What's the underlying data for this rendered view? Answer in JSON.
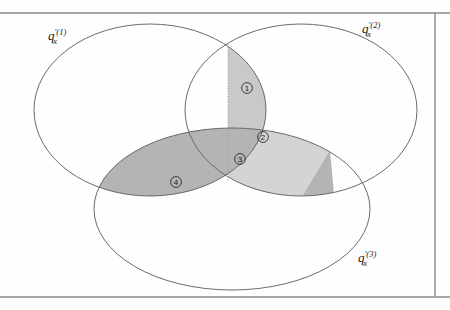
{
  "figure": {
    "kind": "venn-diagram",
    "background_color": "#fefefe",
    "frame_color": "#8a8a8a",
    "outline_color": "#5a5a5a"
  },
  "sets": [
    {
      "id": "set-1",
      "name": "q-prime-x-1",
      "base": "q",
      "prime": "′",
      "superscript": "(1)",
      "subscript": "x",
      "label_x": 48,
      "label_y": 40,
      "cx": 150,
      "cy": 110,
      "rx": 116,
      "ry": 86
    },
    {
      "id": "set-2",
      "name": "q-prime-x-2",
      "base": "q",
      "prime": "′",
      "superscript": "(2)",
      "subscript": "x",
      "label_x": 362,
      "label_y": 33,
      "cx": 301,
      "cy": 110,
      "rx": 116,
      "ry": 86
    },
    {
      "id": "set-3",
      "name": "q-prime-x-3",
      "base": "q",
      "prime": "′",
      "superscript": "(3)",
      "subscript": "x",
      "label_x": 358,
      "label_y": 262,
      "cx": 232,
      "cy": 209,
      "rx": 138,
      "ry": 81
    }
  ],
  "regions": [
    {
      "id": "region-1",
      "number": "①",
      "plain_number": "1",
      "fill": "#c9c9c9",
      "label_x": 247,
      "label_y": 88
    },
    {
      "id": "region-2",
      "number": "②",
      "plain_number": "2",
      "fill": "#d4d4d4",
      "label_x": 263,
      "label_y": 137
    },
    {
      "id": "region-3",
      "number": "③",
      "plain_number": "3",
      "fill": "#b4b4b4",
      "label_x": 240,
      "label_y": 159
    },
    {
      "id": "region-4",
      "number": "④",
      "plain_number": "4",
      "fill": "#b4b4b4",
      "label_x": 176,
      "label_y": 182
    }
  ],
  "frame": {
    "top_line_y": 13,
    "bottom_line_y": 297,
    "right_line_x": 435
  },
  "divider": {
    "name": "dotted-vertical-divider",
    "x": 228,
    "y_top": 44,
    "y_bottom": 181
  }
}
